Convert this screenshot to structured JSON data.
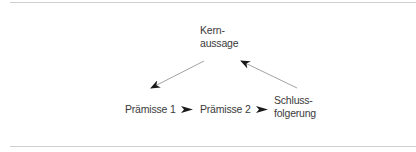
{
  "diagram": {
    "nodes": {
      "kernaussage": {
        "lines": [
          "Kern-",
          "aussage"
        ]
      },
      "praemisse1": {
        "label": "Prämisse 1"
      },
      "praemisse2": {
        "label": "Prämisse 2"
      },
      "schlussfolgerung": {
        "lines": [
          "Schluss-",
          "folgerung"
        ]
      }
    },
    "edges": [
      {
        "from": "kernaussage",
        "to": "praemisse1",
        "style": "thin-line"
      },
      {
        "from": "praemisse1",
        "to": "praemisse2",
        "style": "bold-arrowhead"
      },
      {
        "from": "praemisse2",
        "to": "schlussfolgerung",
        "style": "bold-arrowhead"
      },
      {
        "from": "schlussfolgerung",
        "to": "kernaussage",
        "style": "thin-line"
      }
    ],
    "colors": {
      "text": "#3a3a3a",
      "line": "#8a8a8a",
      "arrowhead": "#1a1a1a",
      "rule": "#cfcfcf"
    }
  }
}
